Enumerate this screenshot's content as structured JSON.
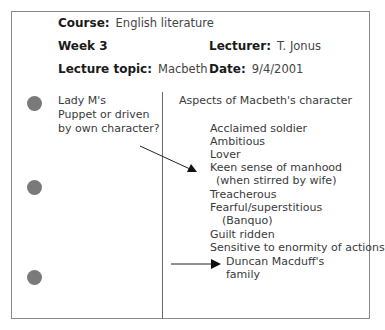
{
  "header": {
    "course": {
      "label": "Course:",
      "value": "English literature"
    },
    "week": {
      "label": "Week 3"
    },
    "lecturer": {
      "label": "Lecturer:",
      "value": "T. Jonus"
    },
    "topic": {
      "label": "Lecture topic:",
      "value": "Macbeth"
    },
    "date": {
      "label": "Date:",
      "value": "9/4/2001"
    }
  },
  "left_column": {
    "lines": [
      "Lady M's",
      "Puppet or driven",
      "by own character?"
    ]
  },
  "right_column": {
    "title": "Aspects of Macbeth's character",
    "items": [
      "Acclaimed soldier",
      "Ambitious",
      "Lover",
      "Keen sense of manhood",
      "(when stirred by wife)",
      "Treacherous",
      "Fearful/superstitious",
      "(Banquo)",
      "Guilt ridden",
      "Sensitive to enormity of actions",
      "Duncan Macduff's",
      "family"
    ]
  },
  "colors": {
    "border": "#8a8a8a",
    "dot": "#7a7a7a",
    "text": "#3a3a3a"
  }
}
